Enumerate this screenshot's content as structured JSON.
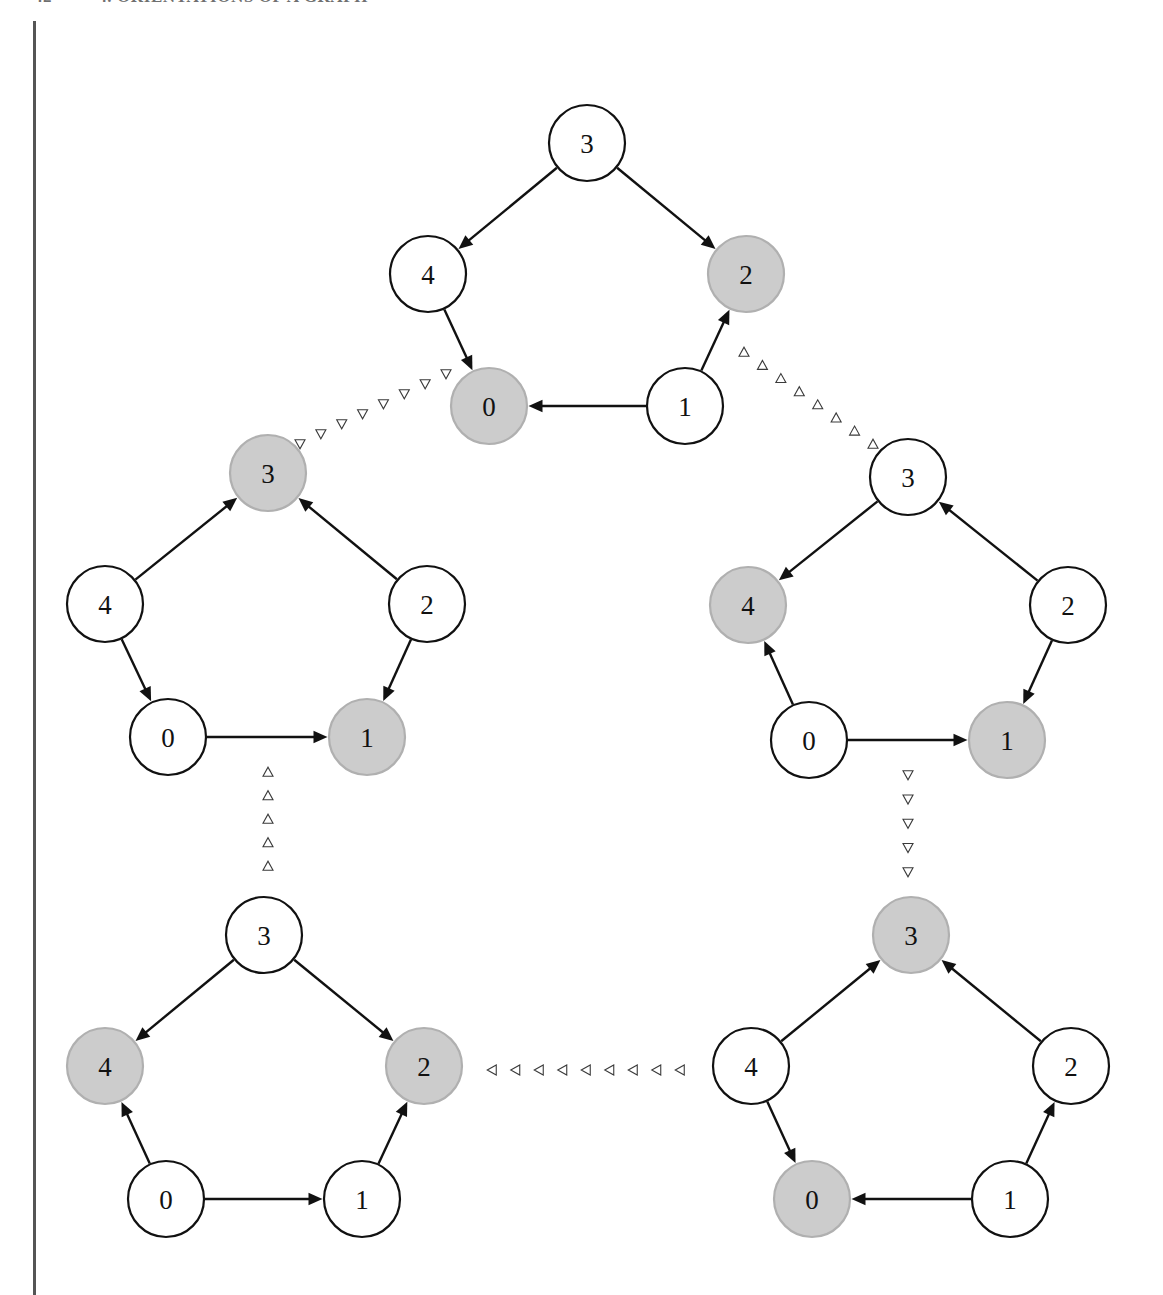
{
  "header": {
    "folio": "42",
    "title": "4.  ORIENTATIONS OF A GRAPH"
  },
  "figure": {
    "caption": "",
    "background_color": "#ffffff",
    "node_fill_plain": "#ffffff",
    "node_fill_shaded": "#cccccc",
    "node_stroke_plain": "#111111",
    "node_stroke_shaded": "#b0b0b0",
    "edge_color": "#111111",
    "connector_color": "#3a3a3a",
    "margin_rule_color": "#555555"
  },
  "chart_data": {
    "type": "diagram",
    "node_radius": 38,
    "clusters": [
      {
        "id": "top",
        "name": "cluster-top",
        "center": [
          587,
          278
        ],
        "nodes": [
          {
            "label": "3",
            "x": 587,
            "y": 143,
            "shaded": false
          },
          {
            "label": "4",
            "x": 428,
            "y": 274,
            "shaded": false
          },
          {
            "label": "2",
            "x": 746,
            "y": 274,
            "shaded": true
          },
          {
            "label": "0",
            "x": 489,
            "y": 406,
            "shaded": true
          },
          {
            "label": "1",
            "x": 685,
            "y": 406,
            "shaded": false
          }
        ],
        "edges": [
          {
            "from": "3",
            "to": "4"
          },
          {
            "from": "3",
            "to": "2"
          },
          {
            "from": "4",
            "to": "0"
          },
          {
            "from": "1",
            "to": "2"
          },
          {
            "from": "1",
            "to": "0"
          }
        ]
      },
      {
        "id": "left-middle",
        "name": "cluster-left-middle",
        "center": [
          268,
          615
        ],
        "nodes": [
          {
            "label": "3",
            "x": 268,
            "y": 473,
            "shaded": true
          },
          {
            "label": "4",
            "x": 105,
            "y": 604,
            "shaded": false
          },
          {
            "label": "2",
            "x": 427,
            "y": 604,
            "shaded": false
          },
          {
            "label": "0",
            "x": 168,
            "y": 737,
            "shaded": false
          },
          {
            "label": "1",
            "x": 367,
            "y": 737,
            "shaded": true
          }
        ],
        "edges": [
          {
            "from": "4",
            "to": "3"
          },
          {
            "from": "2",
            "to": "3"
          },
          {
            "from": "4",
            "to": "0"
          },
          {
            "from": "2",
            "to": "1"
          },
          {
            "from": "0",
            "to": "1"
          }
        ]
      },
      {
        "id": "right-middle",
        "name": "cluster-right-middle",
        "center": [
          908,
          620
        ],
        "nodes": [
          {
            "label": "3",
            "x": 908,
            "y": 477,
            "shaded": false
          },
          {
            "label": "4",
            "x": 748,
            "y": 605,
            "shaded": true
          },
          {
            "label": "2",
            "x": 1068,
            "y": 605,
            "shaded": false
          },
          {
            "label": "0",
            "x": 809,
            "y": 740,
            "shaded": false
          },
          {
            "label": "1",
            "x": 1007,
            "y": 740,
            "shaded": true
          }
        ],
        "edges": [
          {
            "from": "3",
            "to": "4"
          },
          {
            "from": "2",
            "to": "3"
          },
          {
            "from": "0",
            "to": "4"
          },
          {
            "from": "2",
            "to": "1"
          },
          {
            "from": "0",
            "to": "1"
          }
        ]
      },
      {
        "id": "bottom-left",
        "name": "cluster-bottom-left",
        "center": [
          264,
          1076
        ],
        "nodes": [
          {
            "label": "3",
            "x": 264,
            "y": 935,
            "shaded": false
          },
          {
            "label": "4",
            "x": 105,
            "y": 1066,
            "shaded": true
          },
          {
            "label": "2",
            "x": 424,
            "y": 1066,
            "shaded": true
          },
          {
            "label": "0",
            "x": 166,
            "y": 1199,
            "shaded": false
          },
          {
            "label": "1",
            "x": 362,
            "y": 1199,
            "shaded": false
          }
        ],
        "edges": [
          {
            "from": "3",
            "to": "4"
          },
          {
            "from": "3",
            "to": "2"
          },
          {
            "from": "0",
            "to": "4"
          },
          {
            "from": "1",
            "to": "2"
          },
          {
            "from": "0",
            "to": "1"
          }
        ]
      },
      {
        "id": "bottom-right",
        "name": "cluster-bottom-right",
        "center": [
          911,
          1076
        ],
        "nodes": [
          {
            "label": "3",
            "x": 911,
            "y": 935,
            "shaded": true
          },
          {
            "label": "4",
            "x": 751,
            "y": 1066,
            "shaded": false
          },
          {
            "label": "2",
            "x": 1071,
            "y": 1066,
            "shaded": false
          },
          {
            "label": "0",
            "x": 812,
            "y": 1199,
            "shaded": true
          },
          {
            "label": "1",
            "x": 1010,
            "y": 1199,
            "shaded": false
          }
        ],
        "edges": [
          {
            "from": "4",
            "to": "3"
          },
          {
            "from": "2",
            "to": "3"
          },
          {
            "from": "4",
            "to": "0"
          },
          {
            "from": "1",
            "to": "2"
          },
          {
            "from": "1",
            "to": "0"
          }
        ]
      }
    ],
    "connectors": [
      {
        "name": "connector-top-to-left-middle",
        "from_cluster": "top",
        "to_cluster": "left-middle",
        "from": [
          446,
          374
        ],
        "to": [
          300,
          444
        ],
        "marker": "triangle-down",
        "count": 8
      },
      {
        "name": "connector-right-middle-to-top",
        "from_cluster": "right-middle",
        "to_cluster": "top",
        "from": [
          873,
          444
        ],
        "to": [
          744,
          352
        ],
        "marker": "triangle-up",
        "count": 8
      },
      {
        "name": "connector-bottom-left-to-left-middle",
        "from_cluster": "bottom-left",
        "to_cluster": "left-middle",
        "from": [
          268,
          866
        ],
        "to": [
          268,
          772
        ],
        "marker": "triangle-up",
        "count": 5
      },
      {
        "name": "connector-right-middle-to-bottom-right",
        "from_cluster": "right-middle",
        "to_cluster": "bottom-right",
        "from": [
          908,
          775
        ],
        "to": [
          908,
          872
        ],
        "marker": "triangle-down",
        "count": 5
      },
      {
        "name": "connector-bottom-right-to-bottom-left",
        "from_cluster": "bottom-right",
        "to_cluster": "bottom-left",
        "from": [
          680,
          1070
        ],
        "to": [
          492,
          1070
        ],
        "marker": "triangle-left",
        "count": 9
      }
    ]
  }
}
